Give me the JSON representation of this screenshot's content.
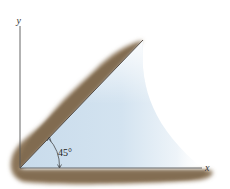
{
  "diagram": {
    "type": "inclined-plane-with-fluid",
    "axes": {
      "x_label": "x",
      "y_label": "y",
      "origin": [
        20,
        168
      ]
    },
    "incline": {
      "angle_label": "45°",
      "angle_degrees": 45,
      "start": [
        20,
        168
      ],
      "end": [
        143,
        40
      ]
    },
    "colors": {
      "soil": "#8a7459",
      "soil_light": "#b7a68e",
      "fluid": "#cfe0ee",
      "axis": "#555555",
      "background": "#ffffff"
    }
  }
}
